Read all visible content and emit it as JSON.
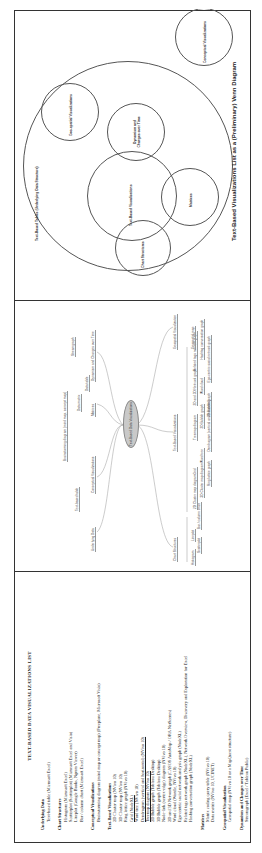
{
  "text_list": {
    "title": "TEXT-BASED DATA VISUALIZATIONS LIST",
    "sections": [
      {
        "heading": "Underlying Data",
        "items": [
          {
            "text": "Text-based table (Microsoft Excel)",
            "underline": false
          }
        ]
      },
      {
        "heading": "Chart Structures",
        "items": [
          {
            "text": "Histogram (Microsoft Excel)",
            "underline": false
          },
          {
            "text": "Scatterplot (Scatterplot) (Microsoft Excel and Visio)",
            "underline": false
          },
          {
            "text": "Lineplot (Google Books, Ngram Viewer)",
            "underline": false
          },
          {
            "text": "Bar / column chart (Microsoft Excel)",
            "underline": false
          }
        ]
      },
      {
        "heading": "Conceptual Visualizations",
        "items": [
          {
            "text": "Brainstorming diagram (mind map or concept map) (Freeplane, Microsoft Visio)",
            "underline": false
          }
        ]
      },
      {
        "heading": "Text-Based Visualizations",
        "items": [
          {
            "text": "2D Cluster map (NVivo 10)",
            "underline": false
          },
          {
            "text": "3D Cluster map (NVivo 10)",
            "underline": false
          },
          {
            "text": "Ring lattice graph (NVivo 10)",
            "underline": false
          },
          {
            "text": "Grid (NodeXL)",
            "underline": true
          },
          {
            "text": "Word tree (NVivo 10)",
            "underline": false
          },
          {
            "text": "Dendrogram (vertical and horizontal) (NVivo 10)",
            "underline": true
          },
          {
            "text": "Treemap diagram (NVivo 10)",
            "underline": true
          },
          {
            "text": "2D Bubble graph (Tableau Desktop)",
            "underline": false
          },
          {
            "text": "3D Bubble graph (Tableau Desktop)",
            "underline": false
          },
          {
            "text": "Node-link (vertex-edge) diagram (NVivo 10)",
            "underline": false
          },
          {
            "text": "2D and 3D Network graph (CASOS AutoMap / ORA NetScenes)",
            "underline": false
          },
          {
            "text": "Word cloud (Wordle, NVivo 10)",
            "underline": false
          },
          {
            "text": "Ego-centric social network analysis graph (NodeXL)",
            "underline": false
          },
          {
            "text": "Related tags network graph (NodeXL), Network Overview, Discovery and Exploration for Excel",
            "underline": false
          },
          {
            "text": "Hashtag conversation graph (NodeXL)",
            "underline": false
          }
        ]
      },
      {
        "heading": "Matrices",
        "items": [
          {
            "text": "Matrix coding query table (NVivo 10)",
            "underline": false
          },
          {
            "text": "Data matrix (NVivo 10, UCINET)",
            "underline": false
          }
        ]
      },
      {
        "heading": "Geospatial Visualization",
        "items": [
          {
            "text": "Geospatial map (NVivo 10 or a MapQuest structure)",
            "underline": false
          }
        ]
      },
      {
        "heading": "Dynamism and Changes over Time",
        "items": [
          {
            "text": "Streamgraph (Excel / Tableau Public)",
            "underline": false
          }
        ]
      }
    ]
  },
  "mind_map": {
    "root": "Text-Based Data Visualizations",
    "branches": {
      "upper": [
        {
          "label": "Underlying Data",
          "children": [
            "Text-based table"
          ]
        },
        {
          "label": "Conceptual Visualizations",
          "children": [
            "Brainstorming diagram (mind map, concept map)"
          ]
        },
        {
          "label": "Matrices",
          "children": [
            "Data matrix",
            "Data table"
          ]
        },
        {
          "label": "Dynamism and Changes over Time",
          "children": [
            "Streamgraph"
          ]
        }
      ],
      "lower": [
        {
          "label": "Chart Structures",
          "children": [
            "Histogram",
            "Scatterplot",
            "Lineplot",
            "Bar / column chart"
          ]
        },
        {
          "label": "Text-Based Visualizations",
          "children": [
            "2D Cluster map diagram",
            "3D Cluster map diagram",
            "Ring lattice graph",
            "Grid",
            "Word tree",
            "Dendrogram (vertical and horizontal)",
            "Treemap diagram",
            "2D Bubble graph",
            "3D Bubble graph",
            "2D and 3D Network graph",
            "Word cloud",
            "Ego-centric social network graph",
            "Related tags network graph",
            "Hashtag conversation graph"
          ]
        },
        {
          "label": "Geospatial Visualization",
          "children": [
            "Geospatial map"
          ]
        }
      ]
    }
  },
  "venn": {
    "caption": "Text-Based Visualizations List as a (Preliminary) Venn Diagram",
    "circles": [
      {
        "label": "Text-Based Tables (Underlying Data Structure)"
      },
      {
        "label": "Geo-spatial Visualizations"
      },
      {
        "label": "Dynamism and Changes over Time"
      },
      {
        "label": "Text-Based Visualizations"
      },
      {
        "label": "Matrices"
      },
      {
        "label": "Chart Structures"
      },
      {
        "label": "Conceptual Visualizations"
      }
    ]
  }
}
